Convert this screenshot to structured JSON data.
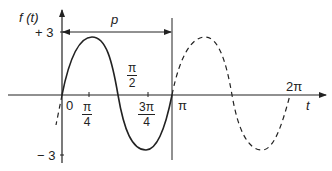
{
  "diagram": {
    "y_axis_label": "f (t)",
    "x_axis_label": "t",
    "y_ticks": {
      "top": "+ 3",
      "bottom": "− 3"
    },
    "period_label": "p",
    "x_ticks": {
      "origin": "0",
      "pi_over_4": {
        "num": "π",
        "den": "4"
      },
      "pi_over_2": {
        "num": "π",
        "den": "2"
      },
      "three_pi_over_4": {
        "num": "3π",
        "den": "4"
      },
      "pi": "π",
      "two_pi": "2π"
    },
    "amplitude": 3,
    "solid_segment": "one period from 0 to π",
    "dashed_segment": "continuation from π to 2π and before 0"
  },
  "colors": {
    "stroke": "#222222",
    "background": "#ffffff"
  }
}
